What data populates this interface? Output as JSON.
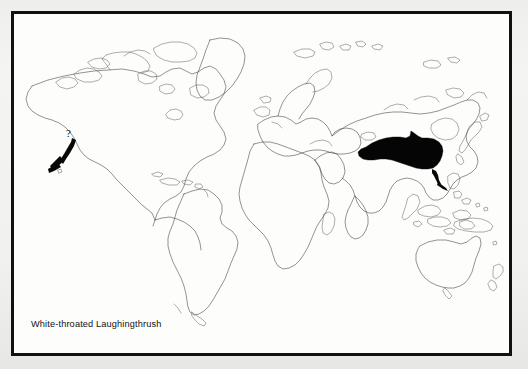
{
  "figure": {
    "type": "distribution-map",
    "caption": "White-throated Laughingthrush",
    "projection": "world-mercator-outline",
    "frame_color": "#111111",
    "paper_color": "#fdfdfc",
    "coastline_color": "#3a3a3a",
    "range_fill_color": "#050505"
  },
  "annotations": {
    "question_mark": "?",
    "introduced_pointer_name": "hawaii-arrow",
    "range_pointer_name": "southeast-china-arrow"
  },
  "map_data": {
    "type": "choropleth-range",
    "title": "White-throated Laughingthrush",
    "regions_shaded": [
      "Himalayan foothills",
      "Northeast India",
      "Myanmar",
      "Southern China",
      "Yunnan",
      "Sichuan",
      "Guangxi",
      "Guangdong"
    ],
    "introduced_marker": "Hawaii (uncertain)",
    "legend": [],
    "land_outlines": [
      "North America",
      "South America",
      "Greenland",
      "Europe",
      "Africa",
      "Asia",
      "Australia",
      "New Zealand",
      "Indonesia",
      "Philippines",
      "Japan",
      "Madagascar",
      "British Isles",
      "Iceland",
      "Caribbean",
      "New Guinea"
    ]
  }
}
